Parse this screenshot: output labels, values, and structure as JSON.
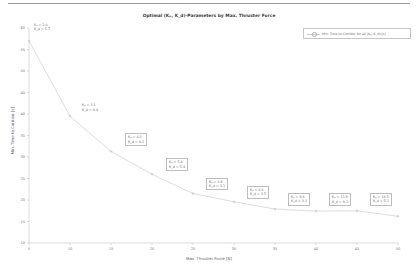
{
  "chart_data": {
    "type": "line",
    "title": "Optimal (Kₚ, K_d)-Parameters by Max. Thruster Force",
    "xlabel": "Max. Thruster Force [N]",
    "ylabel": "Min. Time to Corridor [s]",
    "xlim": [
      5,
      50
    ],
    "ylim": [
      10,
      60
    ],
    "xticks": [
      5,
      10,
      15,
      20,
      25,
      30,
      35,
      40,
      45,
      50
    ],
    "yticks": [
      10,
      15,
      20,
      25,
      30,
      35,
      40,
      45,
      50,
      55,
      60
    ],
    "grid": false,
    "legend_position": "top-right",
    "x": [
      5,
      10,
      15,
      20,
      25,
      30,
      35,
      40,
      45,
      50
    ],
    "values": [
      57.0,
      39.5,
      31.3,
      26.0,
      21.5,
      19.6,
      17.9,
      17.4,
      17.5,
      16.2
    ],
    "series": [
      {
        "name": "Min. Time to Corridor for all (Kₚ, K_d)-[s]",
        "values": [
          57.0,
          39.5,
          31.3,
          26.0,
          21.5,
          19.6,
          17.9,
          17.4,
          17.5,
          16.2
        ]
      }
    ],
    "annotations": [
      {
        "x": 5,
        "y": 57.0,
        "kp": "Kₚ  =   2.0",
        "kd": "K_d  =   5.7",
        "boxed": false
      },
      {
        "x": 10,
        "y": 39.5,
        "kp": "Kₚ  =   3.1",
        "kd": "K_d  =   4.4",
        "boxed": false
      },
      {
        "x": 15,
        "y": 31.3,
        "kp": "Kₚ  =   4.3",
        "kd": "K_d  =   4.2",
        "boxed": true
      },
      {
        "x": 20,
        "y": 26.0,
        "kp": "Kₚ  =   5.4",
        "kd": "K_d  =   5.4",
        "boxed": true
      },
      {
        "x": 25,
        "y": 21.5,
        "kp": "Kₚ  =   6.8",
        "kd": "K_d  =   3.1",
        "boxed": true
      },
      {
        "x": 30,
        "y": 19.6,
        "kp": "Kₚ  =   6.6",
        "kd": "K_d  =   3.5",
        "boxed": true
      },
      {
        "x": 35,
        "y": 17.9,
        "kp": "Kₚ  =   9.4",
        "kd": "K_d  =   3.3",
        "boxed": true
      },
      {
        "x": 40,
        "y": 17.4,
        "kp": "Kₚ  = 13.8",
        "kd": "K_d  =   9.2",
        "boxed": true
      },
      {
        "x": 45,
        "y": 17.5,
        "kp": "Kₚ  = 14.5",
        "kd": "K_d  =   5.1",
        "boxed": true
      }
    ]
  },
  "legend": {
    "entry_label": "Min. Time to Corridor for all (Kₚ, K_d)-[s]"
  },
  "colors": {
    "line": "#cfcfcf",
    "marker": "#b0b0b0",
    "axis": "#b9b9b9",
    "text": "#6d6d6d",
    "title": "#3c3c3c",
    "background": "#ffffff"
  }
}
